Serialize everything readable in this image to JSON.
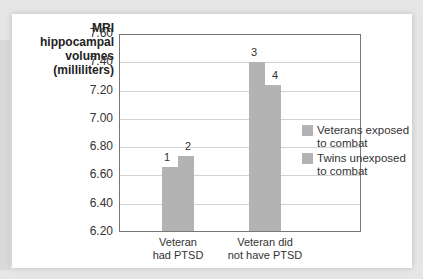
{
  "chart_data": {
    "type": "bar",
    "title": "",
    "ylabel": "MRI hippocampal volumes (milliliters)",
    "xlabel": "",
    "ylim": [
      6.2,
      7.6
    ],
    "yticks": [
      "7.60",
      "7.40",
      "7.20",
      "7.00",
      "6.80",
      "6.60",
      "6.40",
      "6.20"
    ],
    "grid": true,
    "legend_position": "right",
    "categories": [
      "Veteran had PTSD",
      "Veteran did not have PTSD"
    ],
    "series": [
      {
        "name": "Veterans exposed to combat",
        "values": [
          6.66,
          7.4
        ],
        "bar_labels": [
          "1",
          "3"
        ]
      },
      {
        "name": "Twins unexposed to combat",
        "values": [
          6.74,
          7.24
        ],
        "bar_labels": [
          "2",
          "4"
        ]
      }
    ]
  },
  "ylabel_lines": [
    "MRI",
    "hippocampal",
    "volumes",
    "(milliliters)"
  ],
  "categories_lines": [
    [
      "Veteran",
      "had PTSD"
    ],
    [
      "Veteran did",
      "not have PTSD"
    ]
  ],
  "legend": [
    {
      "lines": [
        "Veterans exposed",
        "to combat"
      ],
      "color": "#b3b3b3"
    },
    {
      "lines": [
        "Twins unexposed",
        "to combat"
      ],
      "color": "#b3b3b3"
    }
  ]
}
